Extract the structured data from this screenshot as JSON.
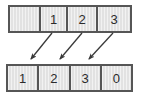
{
  "diagram": {
    "type": "array-shift-diagram",
    "background_color": "#ffffff",
    "cell_fill_color": "#e2e2e2",
    "border_color": "#565656",
    "text_color": "#2b2b2b",
    "arrow_color": "#3a3a3a",
    "top_row": {
      "name": "source-array",
      "cells": [
        {
          "label": "",
          "index": 0
        },
        {
          "label": "1",
          "index": 1
        },
        {
          "label": "2",
          "index": 2
        },
        {
          "label": "3",
          "index": 3
        }
      ]
    },
    "bottom_row": {
      "name": "destination-array",
      "cells": [
        {
          "label": "1",
          "index": 0
        },
        {
          "label": "2",
          "index": 1
        },
        {
          "label": "3",
          "index": 2
        },
        {
          "label": "0",
          "index": 3
        }
      ]
    },
    "arrows": [
      {
        "name": "arrow-1",
        "from_x": 52,
        "from_y": 33,
        "to_x": 31,
        "to_y": 59
      },
      {
        "name": "arrow-2",
        "from_x": 82,
        "from_y": 33,
        "to_x": 60,
        "to_y": 59
      },
      {
        "name": "arrow-3",
        "from_x": 113,
        "from_y": 33,
        "to_x": 89,
        "to_y": 59
      }
    ]
  }
}
